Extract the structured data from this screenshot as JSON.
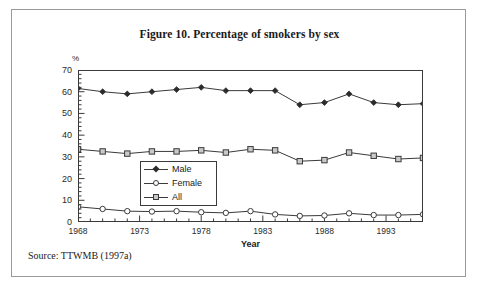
{
  "figure": {
    "title": "Figure 10. Percentage of smokers by sex",
    "source": "Source: TTWMB (1997a)"
  },
  "axes": {
    "y_unit": "%",
    "y_ticks": [
      "70",
      "60",
      "50",
      "40",
      "30",
      "20",
      "10",
      "0"
    ],
    "x_title": "Year",
    "x_ticks": [
      "1968",
      "1973",
      "1978",
      "1983",
      "1988",
      "1993"
    ]
  },
  "legend": {
    "items": [
      {
        "label": "Male",
        "marker": "diamond-filled-icon",
        "color": "#2b2b2b"
      },
      {
        "label": "Female",
        "marker": "circle-open-icon",
        "color": "#3a3a3a"
      },
      {
        "label": "All",
        "marker": "square-open-icon",
        "color": "#3a3a3a"
      }
    ]
  },
  "chart_data": {
    "type": "line",
    "title": "Figure 10. Percentage of smokers by sex",
    "xlabel": "Year",
    "ylabel": "%",
    "xlim": [
      1968,
      1996
    ],
    "ylim": [
      0,
      70
    ],
    "ytick_step": 10,
    "xtick_labels": [
      1968,
      1973,
      1978,
      1983,
      1988,
      1993
    ],
    "xtick_minor_step": 1,
    "grid": false,
    "legend_position": "inside-center-left",
    "x": [
      1968,
      1970,
      1972,
      1974,
      1976,
      1978,
      1980,
      1982,
      1984,
      1986,
      1988,
      1990,
      1992,
      1994,
      1996
    ],
    "series": [
      {
        "name": "Male",
        "marker": "diamond",
        "values": [
          61.5,
          60.0,
          59.0,
          60.0,
          61.0,
          62.0,
          60.5,
          60.5,
          60.5,
          54.0,
          55.0,
          59.0,
          55.0,
          54.0,
          54.5
        ]
      },
      {
        "name": "Female",
        "marker": "circle",
        "values": [
          7.0,
          6.0,
          5.0,
          4.8,
          5.0,
          4.5,
          4.2,
          5.0,
          3.5,
          2.8,
          3.0,
          4.0,
          3.2,
          3.2,
          3.5
        ]
      },
      {
        "name": "All",
        "marker": "square",
        "values": [
          33.5,
          32.5,
          31.5,
          32.5,
          32.5,
          33.0,
          32.0,
          33.5,
          33.0,
          28.0,
          28.5,
          32.0,
          30.5,
          29.0,
          29.5
        ]
      }
    ]
  }
}
